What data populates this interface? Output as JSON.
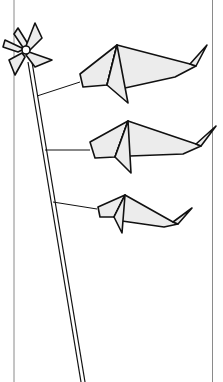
{
  "illustration": {
    "title": "Origami fish windsock with pinwheel",
    "colors": {
      "background": "#ffffff",
      "stroke": "#111111",
      "fill": "#ececec",
      "border": "#8a8a8a"
    },
    "elements": {
      "pinwheel": "pinwheel",
      "pole": "pole",
      "fish_count": 3
    }
  }
}
